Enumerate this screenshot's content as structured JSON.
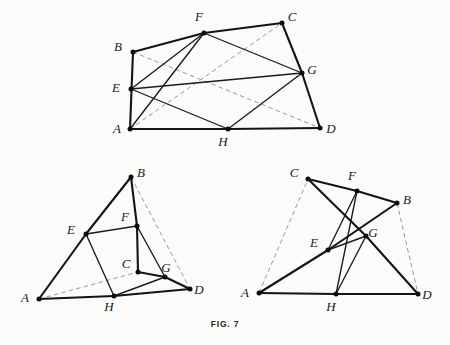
{
  "caption": {
    "text": "FIG. 7"
  },
  "style": {
    "background": "#fbfbf9",
    "ink": "#141414",
    "dash_color": "#8d8d8d",
    "dot_color": "#0d0d0d"
  },
  "figures": [
    {
      "id": "figure-top",
      "name": "convex-quadrilateral-with-varignon-parallelogram",
      "points": {
        "A": {
          "x": 130,
          "y": 129,
          "label": "A",
          "label_x": 117,
          "label_y": 133
        },
        "B": {
          "x": 133,
          "y": 52,
          "label": "B",
          "label_x": 118,
          "label_y": 51
        },
        "C": {
          "x": 282,
          "y": 23,
          "label": "C",
          "label_x": 292,
          "label_y": 21
        },
        "D": {
          "x": 320,
          "y": 128,
          "label": "D",
          "label_x": 331,
          "label_y": 133
        },
        "E": {
          "x": 131,
          "y": 89,
          "label": "E",
          "label_x": 116,
          "label_y": 92
        },
        "F": {
          "x": 204,
          "y": 33,
          "label": "F",
          "label_x": 199,
          "label_y": 21
        },
        "G": {
          "x": 302,
          "y": 73,
          "label": "G",
          "label_x": 312,
          "label_y": 74
        },
        "H": {
          "x": 228,
          "y": 129,
          "label": "H",
          "label_x": 223,
          "label_y": 146
        }
      },
      "solid_thick": [
        [
          "A",
          "B"
        ],
        [
          "B",
          "F"
        ],
        [
          "F",
          "C"
        ],
        [
          "C",
          "G"
        ],
        [
          "G",
          "D"
        ],
        [
          "A",
          "H"
        ],
        [
          "H",
          "D"
        ]
      ],
      "solid_med": [
        [
          "E",
          "F"
        ],
        [
          "F",
          "G"
        ],
        [
          "G",
          "H"
        ],
        [
          "H",
          "E"
        ],
        [
          "A",
          "F"
        ],
        [
          "E",
          "G"
        ]
      ],
      "dashed": [
        [
          "A",
          "C"
        ],
        [
          "B",
          "D"
        ]
      ],
      "dots": [
        "A",
        "B",
        "C",
        "D",
        "E",
        "F",
        "G",
        "H"
      ]
    },
    {
      "id": "figure-lower-left",
      "name": "crossed-quadrilateral-left",
      "points": {
        "A": {
          "x": 39,
          "y": 299,
          "label": "A",
          "label_x": 25,
          "label_y": 302
        },
        "B": {
          "x": 131,
          "y": 177,
          "label": "B",
          "label_x": 141,
          "label_y": 177
        },
        "C": {
          "x": 138,
          "y": 272,
          "label": "C",
          "label_x": 126,
          "label_y": 268
        },
        "D": {
          "x": 190,
          "y": 289,
          "label": "D",
          "label_x": 199,
          "label_y": 294
        },
        "E": {
          "x": 86,
          "y": 234,
          "label": "E",
          "label_x": 71,
          "label_y": 234
        },
        "F": {
          "x": 137,
          "y": 226,
          "label": "F",
          "label_x": 125,
          "label_y": 221
        },
        "G": {
          "x": 165,
          "y": 277,
          "label": "G",
          "label_x": 166,
          "label_y": 272
        },
        "H": {
          "x": 114,
          "y": 296,
          "label": "H",
          "label_x": 109,
          "label_y": 311
        }
      },
      "solid_thick": [
        [
          "A",
          "E"
        ],
        [
          "E",
          "B"
        ],
        [
          "B",
          "F"
        ],
        [
          "F",
          "C"
        ],
        [
          "C",
          "G"
        ],
        [
          "G",
          "D"
        ],
        [
          "A",
          "H"
        ],
        [
          "H",
          "D"
        ]
      ],
      "solid_med": [
        [
          "E",
          "F"
        ],
        [
          "F",
          "G"
        ],
        [
          "G",
          "H"
        ],
        [
          "H",
          "E"
        ]
      ],
      "dashed": [
        [
          "A",
          "C"
        ],
        [
          "B",
          "D"
        ]
      ],
      "dots": [
        "A",
        "B",
        "C",
        "D",
        "E",
        "F",
        "G",
        "H"
      ]
    },
    {
      "id": "figure-lower-right",
      "name": "crossed-quadrilateral-right",
      "points": {
        "A": {
          "x": 259,
          "y": 293,
          "label": "A",
          "label_x": 245,
          "label_y": 297
        },
        "B": {
          "x": 397,
          "y": 203,
          "label": "B",
          "label_x": 407,
          "label_y": 204
        },
        "C": {
          "x": 308,
          "y": 179,
          "label": "C",
          "label_x": 294,
          "label_y": 177
        },
        "D": {
          "x": 418,
          "y": 294,
          "label": "D",
          "label_x": 427,
          "label_y": 299
        },
        "E": {
          "x": 328,
          "y": 250,
          "label": "E",
          "label_x": 314,
          "label_y": 247
        },
        "F": {
          "x": 357,
          "y": 191,
          "label": "F",
          "label_x": 352,
          "label_y": 180
        },
        "G": {
          "x": 366,
          "y": 236,
          "label": "G",
          "label_x": 373,
          "label_y": 237
        },
        "H": {
          "x": 336,
          "y": 294,
          "label": "H",
          "label_x": 331,
          "label_y": 311
        }
      },
      "solid_thick": [
        [
          "A",
          "E"
        ],
        [
          "E",
          "B"
        ],
        [
          "C",
          "F"
        ],
        [
          "F",
          "B"
        ],
        [
          "C",
          "G"
        ],
        [
          "G",
          "D"
        ],
        [
          "A",
          "H"
        ],
        [
          "H",
          "D"
        ]
      ],
      "solid_med": [
        [
          "E",
          "F"
        ],
        [
          "F",
          "H"
        ],
        [
          "G",
          "H"
        ],
        [
          "E",
          "G"
        ]
      ],
      "dashed": [
        [
          "A",
          "C"
        ],
        [
          "B",
          "D"
        ]
      ],
      "dots": [
        "A",
        "B",
        "C",
        "D",
        "E",
        "F",
        "G",
        "H"
      ]
    }
  ]
}
